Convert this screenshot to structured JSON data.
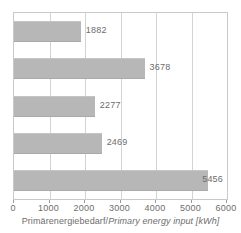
{
  "chart_data": {
    "type": "bar",
    "orientation": "horizontal",
    "title": "",
    "xlabel": "Primärenergiebedarf / Primary energy input [kWh]",
    "ylabel": "",
    "xlim": [
      0,
      6000
    ],
    "xticks": [
      0,
      1000,
      2000,
      3000,
      4000,
      5000,
      6000
    ],
    "xtick_labels": [
      "0",
      "1000",
      "2000",
      "3000",
      "4000",
      "5000",
      "6000"
    ],
    "categories": [
      "",
      "",
      "",
      "",
      ""
    ],
    "values": [
      1882,
      3678,
      2277,
      2469,
      5456
    ],
    "data_labels": [
      "1882",
      "3678",
      "2277",
      "2469",
      "5456"
    ],
    "grid": true,
    "grid_axis": "x",
    "legend": false,
    "unit": "kWh",
    "bar_color": "#b7b7b7",
    "grid_color": "#d3d3d3",
    "frame_color": "#c9c9c9",
    "text_color": "#6d6d6d"
  },
  "axis_title": {
    "german": "Primärenergiebedarf",
    "separator": "/",
    "english": "Primary energy input",
    "unit": "[kWh]"
  }
}
